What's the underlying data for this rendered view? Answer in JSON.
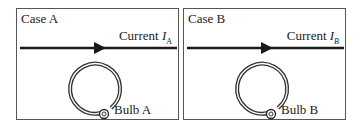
{
  "panels": [
    {
      "case_label": "Case A",
      "current_label": "Current",
      "current_symbol": "I",
      "current_subscript": "A",
      "bulb_label": "Bulb A"
    },
    {
      "case_label": "Case B",
      "current_label": "Current",
      "current_symbol": "I",
      "current_subscript": "B",
      "bulb_label": "Bulb B"
    }
  ],
  "colors": {
    "line": "#1a1a1a",
    "border": "#555555"
  }
}
